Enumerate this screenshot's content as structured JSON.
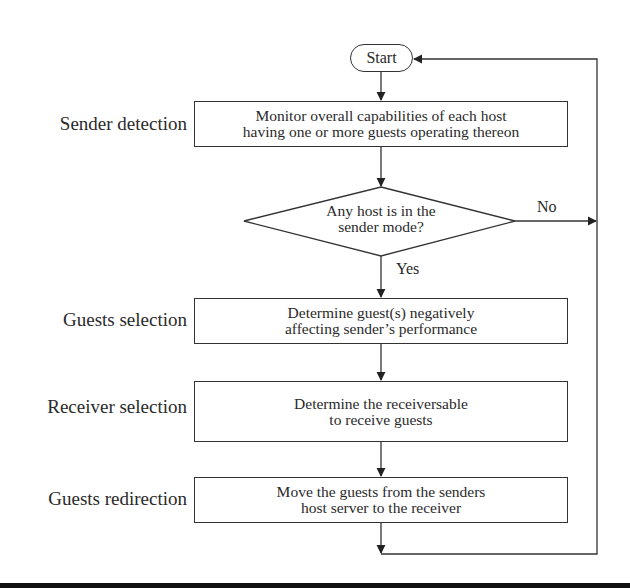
{
  "diagram": {
    "type": "flowchart",
    "start": {
      "label": "Start"
    },
    "stages": [
      {
        "id": "sender-detection",
        "label": "Sender detection",
        "lines": [
          "Monitor overall capabilities of each host",
          "having one or more guests operating thereon"
        ]
      },
      {
        "id": "guests-selection",
        "label": "Guests selection",
        "lines": [
          "Determine guest(s) negatively",
          "affecting sender’s performance"
        ]
      },
      {
        "id": "receiver-selection",
        "label": "Receiver selection",
        "lines": [
          "Determine the receiversable",
          "to receive guests"
        ]
      },
      {
        "id": "guests-redirection",
        "label": "Guests redirection",
        "lines": [
          "Move the guests from the senders",
          "host server to the receiver"
        ]
      }
    ],
    "decision": {
      "lines": [
        "Any host is in the",
        "sender mode?"
      ],
      "yes_label": "Yes",
      "no_label": "No"
    },
    "colors": {
      "line": "#333333",
      "text": "#2a2a2a",
      "background": "#ffffff",
      "bottom_bar": "#111111"
    }
  }
}
